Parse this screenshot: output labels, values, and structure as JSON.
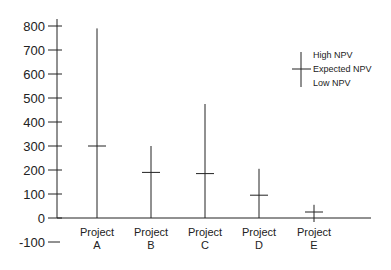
{
  "chart_data": {
    "type": "error-bar",
    "title": "",
    "xlabel": "",
    "ylabel": "",
    "ylim": [
      -100,
      800
    ],
    "yticks": [
      800,
      700,
      600,
      500,
      400,
      300,
      200,
      100,
      0,
      -100
    ],
    "grid": false,
    "legend_position": "right",
    "categories": [
      "Project A",
      "Project B",
      "Project C",
      "Project D",
      "Project E"
    ],
    "category_lines": [
      [
        "Project",
        "A"
      ],
      [
        "Project",
        "B"
      ],
      [
        "Project",
        "C"
      ],
      [
        "Project",
        "D"
      ],
      [
        "Project",
        "E"
      ]
    ],
    "series": [
      {
        "name": "High NPV",
        "values": [
          790,
          300,
          475,
          205,
          55
        ]
      },
      {
        "name": "Expected NPV",
        "values": [
          300,
          190,
          185,
          95,
          25
        ]
      },
      {
        "name": "Low NPV",
        "values": [
          0,
          0,
          0,
          0,
          0
        ]
      }
    ],
    "legend": [
      "High NPV",
      "Expected NPV",
      "Low NPV"
    ]
  },
  "colors": {
    "line": "#222222",
    "background": "#ffffff"
  }
}
